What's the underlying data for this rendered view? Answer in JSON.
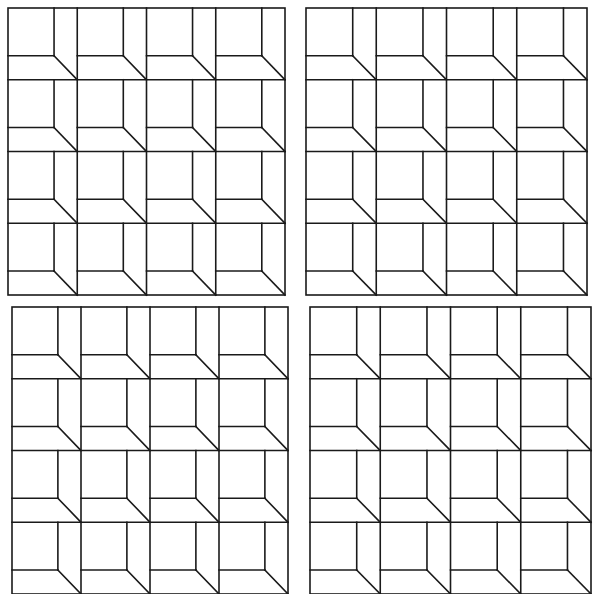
{
  "figure": {
    "stroke_color": "#1a1a1a",
    "background_color": "#ffffff",
    "stroke_width": 1.6,
    "rows": 4,
    "cols": 4,
    "inner_ratio_x": 0.665,
    "inner_ratio_y": 0.665
  },
  "panels": [
    {
      "id": "panel-top-left",
      "x": 8,
      "y": 8,
      "width": 277,
      "height": 287
    },
    {
      "id": "panel-top-right",
      "x": 306,
      "y": 8,
      "width": 281,
      "height": 287
    },
    {
      "id": "panel-bottom-left",
      "x": 12,
      "y": 307,
      "width": 276,
      "height": 287
    },
    {
      "id": "panel-bottom-right",
      "x": 310,
      "y": 307,
      "width": 281,
      "height": 287
    }
  ]
}
